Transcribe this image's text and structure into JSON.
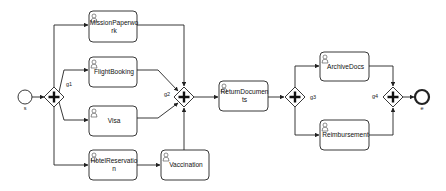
{
  "diagram": {
    "type": "bpmn-process",
    "colors": {
      "stroke": "#222222",
      "fill": "#ffffff",
      "text": "#111111"
    },
    "start_event": {
      "id": "s",
      "label": "s",
      "cx": 25,
      "cy": 97,
      "r": 7
    },
    "end_event": {
      "id": "e",
      "label": "e",
      "cx": 422,
      "cy": 97,
      "r": 7
    },
    "gateways": [
      {
        "id": "g1",
        "label": "g1",
        "type": "parallel",
        "cx": 54,
        "cy": 97,
        "label_x": 66,
        "label_y": 86
      },
      {
        "id": "g2",
        "label": "g2",
        "type": "parallel",
        "cx": 184,
        "cy": 97,
        "label_x": 164,
        "label_y": 96
      },
      {
        "id": "g3",
        "label": "g3",
        "type": "parallel",
        "cx": 295,
        "cy": 97,
        "label_x": 310,
        "label_y": 99
      },
      {
        "id": "g4",
        "label": "g4",
        "type": "parallel",
        "cx": 393,
        "cy": 97,
        "label_x": 372,
        "label_y": 98
      }
    ],
    "tasks": [
      {
        "id": "mission",
        "type": "user-task",
        "lines": [
          "MissionPaperwo",
          "rk"
        ],
        "x": 89,
        "y": 11,
        "w": 48,
        "h": 31
      },
      {
        "id": "flight",
        "type": "user-task",
        "lines": [
          "FlightBooking"
        ],
        "x": 89,
        "y": 57,
        "w": 48,
        "h": 30
      },
      {
        "id": "visa",
        "type": "user-task",
        "lines": [
          "Visa"
        ],
        "x": 89,
        "y": 106,
        "w": 48,
        "h": 30
      },
      {
        "id": "hotel",
        "type": "user-task",
        "lines": [
          "HotelReservatio",
          "n"
        ],
        "x": 89,
        "y": 150,
        "w": 48,
        "h": 30
      },
      {
        "id": "vaccination",
        "type": "user-task",
        "lines": [
          "Vaccination"
        ],
        "x": 161,
        "y": 150,
        "w": 48,
        "h": 30
      },
      {
        "id": "return",
        "type": "user-task",
        "lines": [
          "ReturnDocumen",
          "ts"
        ],
        "x": 219,
        "y": 81,
        "w": 49,
        "h": 30
      },
      {
        "id": "archive",
        "type": "user-task",
        "lines": [
          "ArchiveDocs"
        ],
        "x": 320,
        "y": 52,
        "w": 49,
        "h": 29
      },
      {
        "id": "reimbursement",
        "type": "user-task",
        "lines": [
          "Reimbursement"
        ],
        "x": 320,
        "y": 120,
        "w": 49,
        "h": 30
      }
    ],
    "flows": [
      {
        "id": "f-s-g1",
        "points": "32,97 44,97"
      },
      {
        "id": "f-g1-mission",
        "points": "54,87 54,25 88,25"
      },
      {
        "id": "f-g1-flight",
        "points": "59,92 64,70 88,70"
      },
      {
        "id": "f-g1-visa",
        "points": "59,102 64,120 88,120"
      },
      {
        "id": "f-g1-hotel",
        "points": "54,107 54,165 88,165"
      },
      {
        "id": "f-hotel-vacc",
        "points": "137,165 160,165"
      },
      {
        "id": "f-mission-g2",
        "points": "137,25 184,25 184,86"
      },
      {
        "id": "f-flight-g2",
        "points": "137,70 158,70 178,91"
      },
      {
        "id": "f-visa-g2",
        "points": "137,118 158,118 178,103"
      },
      {
        "id": "f-vacc-g2",
        "points": "184,150 184,108"
      },
      {
        "id": "f-g2-return",
        "points": "194,97 218,97"
      },
      {
        "id": "f-return-g3",
        "points": "268,97 284,97"
      },
      {
        "id": "f-g3-archive",
        "points": "295,87 295,66 319,66"
      },
      {
        "id": "f-g3-reimb",
        "points": "295,107 295,135 319,135"
      },
      {
        "id": "f-archive-g4",
        "points": "369,66 393,66 393,86"
      },
      {
        "id": "f-reimb-g4",
        "points": "369,135 393,135 393,108"
      },
      {
        "id": "f-g4-e",
        "points": "403,97 414,97"
      }
    ]
  }
}
